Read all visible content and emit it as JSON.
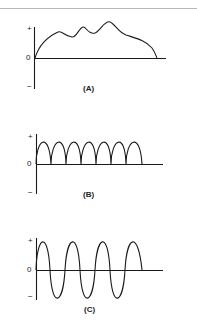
{
  "figure": {
    "panels": [
      {
        "id": "A",
        "caption": "(A)",
        "plus_label": "+",
        "zero_label": "0",
        "minus_label": "−",
        "description": "Irregular positive-only waveform rising from zero with several bumps, then falling back to zero"
      },
      {
        "id": "B",
        "caption": "(B)",
        "plus_label": "+",
        "zero_label": "0",
        "minus_label": "−",
        "description": "Full-wave rectified waveform: seven positive half-sine arches"
      },
      {
        "id": "C",
        "caption": "(C)",
        "plus_label": "+",
        "zero_label": "0",
        "minus_label": "−",
        "description": "Alternating sine wave: about 3.5 cycles swinging between positive and negative"
      }
    ]
  },
  "colors": {
    "stroke": "#1a1a1a",
    "background": "#ffffff",
    "rule": "#b8b8b8"
  }
}
